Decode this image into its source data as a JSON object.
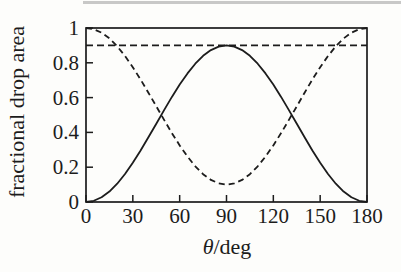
{
  "figure": {
    "background": "#fdfdfb",
    "line_color": "#1c1c1c"
  },
  "chart_data": {
    "type": "line",
    "title": "",
    "xlabel": "θ/deg",
    "ylabel": "fractional drop area",
    "xlim": [
      0,
      180
    ],
    "ylim": [
      0,
      1
    ],
    "grid": false,
    "legend": null,
    "xticks": [
      0,
      30,
      60,
      90,
      120,
      150,
      180
    ],
    "xtick_labels": [
      "0",
      "30",
      "60",
      "90",
      "120",
      "150",
      "180"
    ],
    "yticks": [
      0,
      0.2,
      0.4,
      0.6,
      0.8,
      1
    ],
    "ytick_labels": [
      "0",
      "0.2",
      "0.4",
      "0.6",
      "0.8",
      "1"
    ],
    "x": [
      0,
      5,
      10,
      15,
      20,
      25,
      30,
      35,
      40,
      45,
      50,
      55,
      60,
      65,
      70,
      75,
      80,
      85,
      90,
      95,
      100,
      105,
      110,
      115,
      120,
      125,
      130,
      135,
      140,
      145,
      150,
      155,
      160,
      165,
      170,
      175,
      180
    ],
    "series": [
      {
        "name": "solid",
        "style": "solid",
        "values": [
          0.0,
          0.007,
          0.027,
          0.06,
          0.105,
          0.161,
          0.225,
          0.296,
          0.372,
          0.45,
          0.528,
          0.604,
          0.675,
          0.739,
          0.795,
          0.84,
          0.873,
          0.893,
          0.9,
          0.893,
          0.873,
          0.84,
          0.795,
          0.739,
          0.675,
          0.604,
          0.528,
          0.45,
          0.372,
          0.296,
          0.225,
          0.161,
          0.105,
          0.06,
          0.027,
          0.007,
          0.0
        ]
      },
      {
        "name": "dashed",
        "style": "dashed",
        "values": [
          1.0,
          0.993,
          0.973,
          0.94,
          0.895,
          0.839,
          0.775,
          0.704,
          0.628,
          0.55,
          0.472,
          0.396,
          0.325,
          0.261,
          0.205,
          0.16,
          0.127,
          0.107,
          0.1,
          0.107,
          0.127,
          0.16,
          0.205,
          0.261,
          0.325,
          0.396,
          0.472,
          0.55,
          0.628,
          0.704,
          0.775,
          0.839,
          0.895,
          0.94,
          0.973,
          0.993,
          1.0
        ]
      }
    ],
    "ref_lines": [
      {
        "name": "horizontal-dashed-reference",
        "y": 0.9,
        "style": "dashed"
      }
    ]
  }
}
